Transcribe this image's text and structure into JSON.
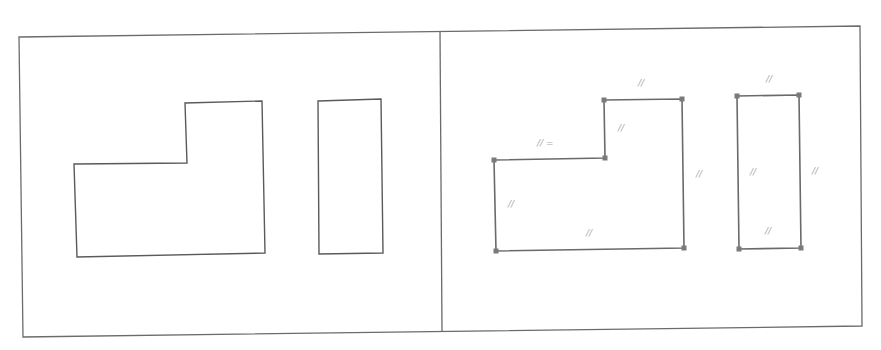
{
  "figure": {
    "panels": [
      {
        "id": "left",
        "description": "Rough sketch",
        "shapes": [
          {
            "type": "l-shape",
            "points": [
              [
                74,
                164
              ],
              [
                187,
                163
              ],
              [
                185,
                103
              ],
              [
                262,
                101
              ],
              [
                265,
                253
              ],
              [
                77,
                257
              ]
            ]
          },
          {
            "type": "rectangle",
            "points": [
              [
                318,
                101
              ],
              [
                381,
                99
              ],
              [
                383,
                253
              ],
              [
                319,
                254
              ]
            ]
          }
        ]
      },
      {
        "id": "right",
        "description": "Beautified sketch with parallel constraints",
        "shapes": [
          {
            "type": "l-shape",
            "points": [
              [
                494,
                160
              ],
              [
                605,
                158
              ],
              [
                604,
                100
              ],
              [
                682,
                99
              ],
              [
                684,
                248
              ],
              [
                496,
                251
              ]
            ]
          },
          {
            "type": "rectangle",
            "points": [
              [
                737,
                96
              ],
              [
                799,
                95
              ],
              [
                801,
                248
              ],
              [
                739,
                249
              ]
            ]
          }
        ],
        "constraint_marks": [
          {
            "label": "//",
            "x": 638,
            "y": 86
          },
          {
            "label": "//",
            "x": 618,
            "y": 131
          },
          {
            "label": "// =",
            "x": 537,
            "y": 146
          },
          {
            "label": "//",
            "x": 696,
            "y": 177
          },
          {
            "label": "//",
            "x": 508,
            "y": 207
          },
          {
            "label": "//",
            "x": 586,
            "y": 236
          },
          {
            "label": "//",
            "x": 766,
            "y": 82
          },
          {
            "label": "//",
            "x": 750,
            "y": 175
          },
          {
            "label": "//",
            "x": 812,
            "y": 174
          },
          {
            "label": "//",
            "x": 765,
            "y": 234
          }
        ]
      }
    ]
  }
}
